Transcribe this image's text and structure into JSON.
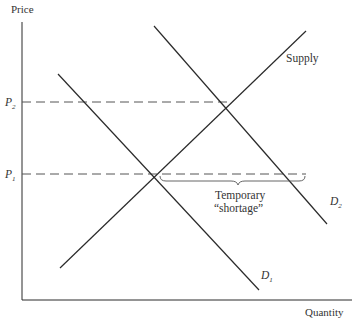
{
  "diagram": {
    "type": "supply-demand",
    "axes": {
      "y_label": "Price",
      "x_label": "Quantity"
    },
    "price_levels": [
      {
        "id": "p2",
        "symbol": "P",
        "subscript": "2"
      },
      {
        "id": "p1",
        "symbol": "P",
        "subscript": "1"
      }
    ],
    "curves": {
      "supply": {
        "label": "Supply"
      },
      "d1": {
        "symbol": "D",
        "subscript": "1"
      },
      "d2": {
        "symbol": "D",
        "subscript": "2"
      }
    },
    "annotation": {
      "line1": "Temporary",
      "line2": "“shortage”"
    },
    "colors": {
      "line": "#2a2a2a",
      "dashed": "#555555",
      "text": "#333333"
    }
  }
}
